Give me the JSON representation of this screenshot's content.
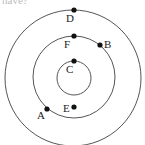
{
  "caption": "have?",
  "colors": {
    "stroke": "#555555",
    "dot": "#111111",
    "label": "#222222"
  },
  "circles": [
    {
      "id": "outer",
      "cx": 73,
      "cy": 78,
      "r": 68
    },
    {
      "id": "middle",
      "cx": 74,
      "cy": 77,
      "r": 41
    },
    {
      "id": "inner",
      "cx": 74,
      "cy": 78,
      "r": 17
    }
  ],
  "points": [
    {
      "name": "D",
      "x": 74,
      "y": 10,
      "label_x": 66,
      "label_y": 22
    },
    {
      "name": "F",
      "x": 74,
      "y": 36,
      "label_x": 64,
      "label_y": 48
    },
    {
      "name": "B",
      "x": 100,
      "y": 45,
      "label_x": 104,
      "label_y": 48
    },
    {
      "name": "C",
      "x": 74,
      "y": 61,
      "label_x": 66,
      "label_y": 73
    },
    {
      "name": "E",
      "x": 74,
      "y": 107,
      "label_x": 63,
      "label_y": 112
    },
    {
      "name": "A",
      "x": 47,
      "y": 109,
      "label_x": 37,
      "label_y": 119
    }
  ]
}
